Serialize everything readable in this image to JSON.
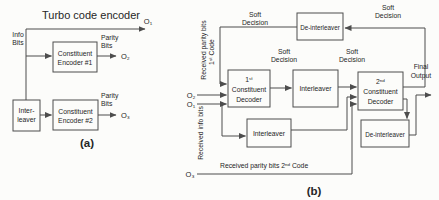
{
  "figure": {
    "colors": {
      "background": "#fcfcfa",
      "line": "#4d4d4d",
      "text": "#262626"
    },
    "panel_a": {
      "title": "Turbo code encoder",
      "caption": "(a)",
      "io": {
        "o1": "O₁",
        "o2": "O₂",
        "o3": "O₃"
      },
      "labels": {
        "info_l1": "Info",
        "info_l2": "Bits",
        "parity_top_l1": "Parity",
        "parity_top_l2": "Bits",
        "parity_bottom_l1": "Parity",
        "parity_bottom_l2": "Bits"
      },
      "boxes": {
        "encoder1_l1": "Constituent",
        "encoder1_l2": "Encoder #1",
        "encoder2_l1": "Constituent",
        "encoder2_l2": "Encoder #2",
        "interleaver_l1": "Inter-",
        "interleaver_l2": "leaver"
      }
    },
    "panel_b": {
      "caption": "(b)",
      "io": {
        "o1": "O₁",
        "o2": "O₂",
        "o3": "O₃"
      },
      "labels": {
        "soft_l1": "Soft",
        "soft_l2": "Decision",
        "final_l1": "Final",
        "final_l2": "Output",
        "received_parity1_l1": "Received parity bits",
        "received_parity1_l2": "1ˢᵗ Code",
        "received_info": "Received info bits",
        "received_parity2": "Received parity bits 2ⁿᵈ Code"
      },
      "boxes": {
        "deinterleaver_top": "De-interleaver",
        "decoder1_l1": "1ˢᵗ",
        "decoder1_l2": "Constituent",
        "decoder1_l3": "Decoder",
        "interleaver_mid": "Interleaver",
        "decoder2_l1": "2ⁿᵈ",
        "decoder2_l2": "Constituent",
        "decoder2_l3": "Decoder",
        "interleaver_low": "Interleaver",
        "deinterleaver_low": "De-interleaver"
      }
    }
  }
}
